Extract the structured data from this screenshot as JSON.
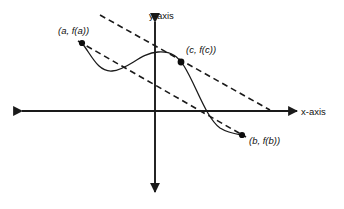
{
  "figure": {
    "background_color": "#ffffff",
    "stroke_color": "#1a1a1a",
    "axes": {
      "x_label": "x-axis",
      "y_label": "y-axis",
      "origin": {
        "x": 155,
        "y": 111
      },
      "x_axis": {
        "x1": 22,
        "y1": 111,
        "x2": 297,
        "y2": 111,
        "arrows": "both"
      },
      "y_axis": {
        "x1": 155,
        "y1": 22,
        "x2": 155,
        "y2": 192,
        "arrows": "both"
      }
    },
    "points": [
      {
        "id": "a",
        "label": "(a, f(a))",
        "x": 82,
        "y": 43,
        "label_x": 58,
        "label_y": 34
      },
      {
        "id": "c",
        "label": "(c, f(c))",
        "x": 181,
        "y": 62,
        "label_x": 186,
        "label_y": 53
      },
      {
        "id": "b",
        "label": "(b, f(b))",
        "x": 242,
        "y": 135,
        "label_x": 249,
        "label_y": 144
      }
    ],
    "curve": {
      "name": "f(x)",
      "path": "M 82 43 C 92 56, 98 72, 112 71 C 128 70, 140 53, 158 52 C 172 51, 178 57, 184 66 C 196 85, 206 118, 220 128 C 228 133, 236 134, 242 135"
    },
    "dashed_lines": [
      {
        "name": "tangent-line-at-c",
        "x1": 100,
        "y1": 15,
        "x2": 270,
        "y2": 110,
        "dash": "6 4"
      },
      {
        "name": "secant-line-a-to-b",
        "x1": 78,
        "y1": 41,
        "x2": 246,
        "y2": 137,
        "dash": "6 4"
      }
    ]
  }
}
